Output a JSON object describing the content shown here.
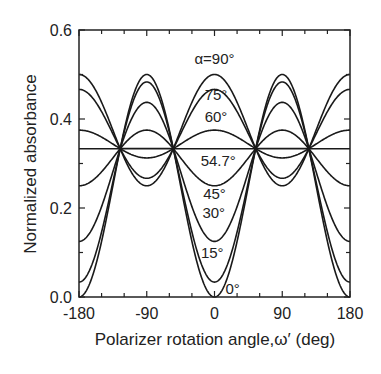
{
  "chart_data": {
    "type": "line",
    "title": "",
    "xlabel": "Polarizer rotation angle,ω′ (deg)",
    "ylabel": "Normalized absorbance",
    "xlim": [
      -180,
      180
    ],
    "ylim": [
      0.0,
      0.6
    ],
    "xticks": [
      -180,
      -90,
      0,
      90,
      180
    ],
    "xtick_labels": [
      "-180",
      "-90",
      "0",
      "90",
      "180"
    ],
    "xminor_step": 30,
    "yticks": [
      0.0,
      0.2,
      0.4,
      0.6
    ],
    "ytick_labels": [
      "0.0",
      "0.2",
      "0.4",
      "0.6"
    ],
    "yminor_step": 0.1,
    "grid": false,
    "legend": "inline labels",
    "x": [
      -180,
      -150,
      -120,
      -90,
      -60,
      -30,
      0,
      30,
      60,
      90,
      120,
      150,
      180
    ],
    "series": [
      {
        "name": "α=90°",
        "alpha": 90,
        "values": [
          0.5,
          0.354,
          0.292,
          0.25,
          0.292,
          0.354,
          0.5,
          0.354,
          0.292,
          0.25,
          0.292,
          0.354,
          0.5
        ]
      },
      {
        "name": "75°",
        "alpha": 75,
        "values": [
          0.467,
          0.35,
          0.3,
          0.267,
          0.3,
          0.35,
          0.467,
          0.35,
          0.3,
          0.267,
          0.3,
          0.35,
          0.467
        ]
      },
      {
        "name": "60°",
        "alpha": 60,
        "values": [
          0.375,
          0.339,
          0.323,
          0.313,
          0.323,
          0.339,
          0.375,
          0.339,
          0.323,
          0.313,
          0.323,
          0.339,
          0.375
        ]
      },
      {
        "name": "54.7°",
        "alpha": 54.7,
        "values": [
          0.333,
          0.333,
          0.333,
          0.333,
          0.333,
          0.333,
          0.333,
          0.333,
          0.333,
          0.333,
          0.333,
          0.333,
          0.333
        ]
      },
      {
        "name": "45°",
        "alpha": 45,
        "values": [
          0.25,
          0.323,
          0.354,
          0.375,
          0.354,
          0.323,
          0.25,
          0.323,
          0.354,
          0.375,
          0.354,
          0.323,
          0.25
        ]
      },
      {
        "name": "30°",
        "alpha": 30,
        "values": [
          0.125,
          0.307,
          0.385,
          0.438,
          0.385,
          0.307,
          0.125,
          0.307,
          0.385,
          0.438,
          0.385,
          0.307,
          0.125
        ]
      },
      {
        "name": "15°",
        "alpha": 15,
        "values": [
          0.033,
          0.295,
          0.407,
          0.483,
          0.407,
          0.295,
          0.033,
          0.295,
          0.407,
          0.483,
          0.407,
          0.295,
          0.033
        ]
      },
      {
        "name": "0°",
        "alpha": 0,
        "values": [
          0.0,
          0.292,
          0.417,
          0.5,
          0.417,
          0.292,
          0.0,
          0.292,
          0.417,
          0.5,
          0.417,
          0.292,
          0.0
        ]
      }
    ],
    "annotations": [
      {
        "text": "α=90°",
        "x": 0,
        "y": 0.535
      },
      {
        "text": "75°",
        "x": 2,
        "y": 0.455
      },
      {
        "text": "60°",
        "x": 2,
        "y": 0.405
      },
      {
        "text": "54.7°",
        "x": 5,
        "y": 0.305
      },
      {
        "text": "45°",
        "x": 0,
        "y": 0.232
      },
      {
        "text": "30°",
        "x": -1,
        "y": 0.188
      },
      {
        "text": "15°",
        "x": -3,
        "y": 0.1
      },
      {
        "text": "0°",
        "x": 24,
        "y": 0.018
      }
    ],
    "intersections_x": [
      -125.3,
      -54.7,
      54.7,
      125.3
    ],
    "intersection_y": 0.333
  },
  "colors": {
    "line": "#1a1a1a",
    "axis": "#222222",
    "background": "#ffffff"
  }
}
